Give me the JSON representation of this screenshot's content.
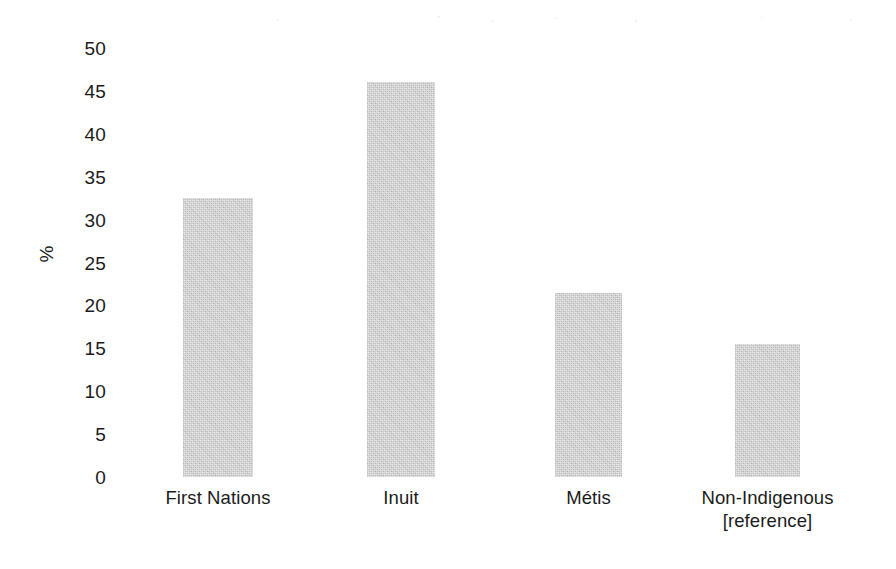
{
  "chart_data": {
    "type": "bar",
    "title": "",
    "subtitle": "",
    "xlabel": "",
    "ylabel": "%",
    "categories": [
      "First Nations",
      "Inuit",
      "Métis",
      "Non-Indigenous\n[reference]"
    ],
    "category_lines": [
      [
        "First Nations"
      ],
      [
        "Inuit"
      ],
      [
        "Métis"
      ],
      [
        "Non-Indigenous",
        "[reference]"
      ]
    ],
    "values": [
      32.5,
      46.0,
      21.5,
      15.5
    ],
    "ylim": [
      0,
      50
    ],
    "ytick_values": [
      50,
      45,
      40,
      35,
      30,
      25,
      20,
      15,
      10,
      5,
      0
    ],
    "ytick_labels": [
      "50",
      "45",
      "40",
      "35",
      "30",
      "25",
      "20",
      "15",
      "10",
      "5",
      "0"
    ],
    "grid": false,
    "legend": null,
    "legend_position": "none",
    "bar_color": "#c9c9c9",
    "background_color": "#ffffff",
    "text_color": "#1b1b1b",
    "annotations": []
  },
  "axis": {
    "y_title": "%",
    "ticks": [
      {
        "label": "50",
        "value": 50
      },
      {
        "label": "45",
        "value": 45
      },
      {
        "label": "40",
        "value": 40
      },
      {
        "label": "35",
        "value": 35
      },
      {
        "label": "30",
        "value": 30
      },
      {
        "label": "25",
        "value": 25
      },
      {
        "label": "20",
        "value": 20
      },
      {
        "label": "15",
        "value": 15
      },
      {
        "label": "10",
        "value": 10
      },
      {
        "label": "5",
        "value": 5
      },
      {
        "label": "0",
        "value": 0
      }
    ]
  },
  "bars": [
    {
      "label": "First Nations",
      "line1": "First Nations",
      "line2": "",
      "value": 32.5
    },
    {
      "label": "Inuit",
      "line1": "Inuit",
      "line2": "",
      "value": 46.0
    },
    {
      "label": "Métis",
      "line1": "Métis",
      "line2": "",
      "value": 21.5
    },
    {
      "label": "Non-Indigenous",
      "line1": "Non-Indigenous",
      "line2": "[reference]",
      "value": 15.5
    }
  ]
}
